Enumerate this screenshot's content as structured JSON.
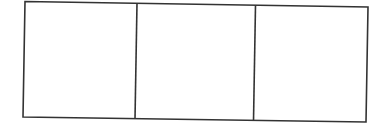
{
  "diagram": {
    "type": "three-panel-box",
    "stroke_color": "#333333",
    "background": "#ffffff",
    "stroke_width": 1.6,
    "outer_frame": {
      "top_left": [
        25,
        1.5
      ],
      "top_right": [
        368,
        7
      ],
      "bottom_right": [
        366,
        122
      ],
      "bottom_left": [
        23,
        117
      ]
    },
    "dividers": [
      {
        "top": [
          137,
          3.3
        ],
        "bottom": [
          135,
          119
        ]
      },
      {
        "top": [
          255.5,
          5.2
        ],
        "bottom": [
          253.5,
          121
        ]
      }
    ],
    "panels": [
      {
        "label": ""
      },
      {
        "label": ""
      },
      {
        "label": ""
      }
    ]
  }
}
